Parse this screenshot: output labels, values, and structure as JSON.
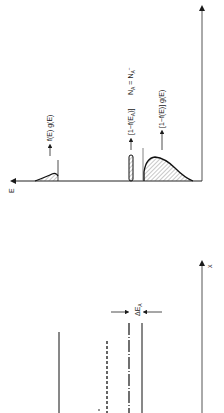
{
  "figure": {
    "orientation": "rotated -90deg",
    "top_panel": {
      "axis_label": "E",
      "labels": {
        "f_g": "f(E) g(E)",
        "acceptor": "[1−f(E",
        "acceptor_sub": "A",
        "acceptor_tail": ")]",
        "na_eq": "N",
        "na_sub": "A",
        "na_eq2": " = N",
        "na_sub2": "A",
        "na_sup": "−",
        "one_minus_f_g": "[1−f(E)] g(E)"
      }
    },
    "bottom_panel": {
      "axis_label": "x",
      "delta_label": "ΔE",
      "delta_sub": "A"
    },
    "colors": {
      "ink": "#1a1a1a",
      "axis": "#555555",
      "background": "#ffffff"
    }
  }
}
